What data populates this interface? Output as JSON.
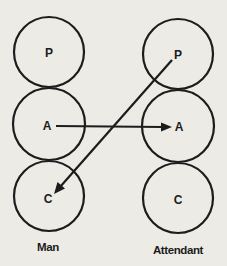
{
  "diagram": {
    "columns": [
      {
        "id": "man",
        "label": "Man",
        "nodes": [
          {
            "id": "man-p",
            "label": "P"
          },
          {
            "id": "man-a",
            "label": "A"
          },
          {
            "id": "man-c",
            "label": "C"
          }
        ]
      },
      {
        "id": "attendant",
        "label": "Attendant",
        "nodes": [
          {
            "id": "att-p",
            "label": "P"
          },
          {
            "id": "att-a",
            "label": "A"
          },
          {
            "id": "att-c",
            "label": "C"
          }
        ]
      }
    ],
    "edges": [
      {
        "from": "man-a",
        "to": "att-a"
      },
      {
        "from": "att-p",
        "to": "man-c"
      }
    ],
    "colors": {
      "ink": "#1c1c1c",
      "background": "#ecebe6"
    }
  }
}
